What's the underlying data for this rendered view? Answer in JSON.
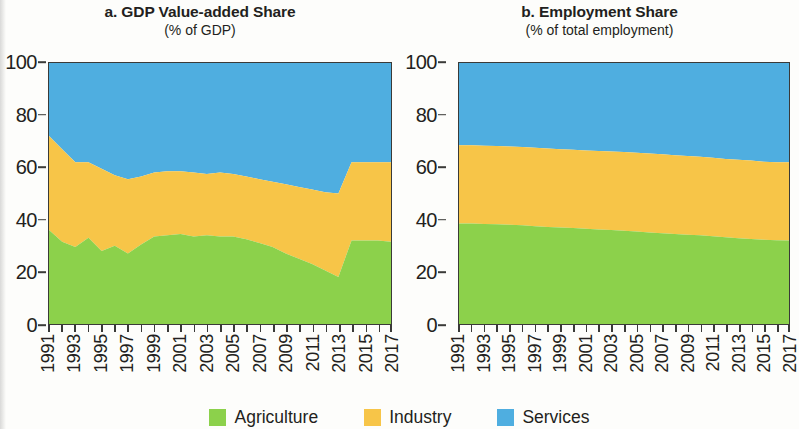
{
  "figure": {
    "legend": {
      "items": [
        {
          "label": "Agriculture",
          "color": "#8CD14B",
          "key": "agriculture"
        },
        {
          "label": "Industry",
          "color": "#F7C548",
          "key": "industry"
        },
        {
          "label": "Services",
          "color": "#4FAEE0",
          "key": "services"
        }
      ]
    }
  },
  "panels": {
    "a": {
      "title": "a. GDP Value-added Share",
      "subtitle": "(% of GDP)"
    },
    "b": {
      "title": "b. Employment Share",
      "subtitle": "(% of total employment)"
    }
  },
  "axis": {
    "y_ticks": [
      "0",
      "20",
      "40",
      "60",
      "80",
      "100"
    ],
    "y_min": 0,
    "y_max": 100,
    "x_labels": [
      "1991",
      "1993",
      "1995",
      "1997",
      "1999",
      "2001",
      "2003",
      "2005",
      "2007",
      "2009",
      "2011",
      "2013",
      "2015",
      "2017"
    ]
  },
  "chart_data": [
    {
      "type": "area",
      "stacked": true,
      "normalized": true,
      "title": "a. GDP Value-added Share",
      "subtitle": "(% of GDP)",
      "xlabel": "",
      "ylabel": "(% of GDP)",
      "ylim": [
        0,
        100
      ],
      "grid": false,
      "legend_position": "bottom",
      "x": [
        1991,
        1992,
        1993,
        1994,
        1995,
        1996,
        1997,
        1998,
        1999,
        2000,
        2001,
        2002,
        2003,
        2004,
        2005,
        2006,
        2007,
        2008,
        2009,
        2010,
        2011,
        2012,
        2013,
        2014,
        2015,
        2016,
        2017
      ],
      "tick_labels": [
        "1991",
        "1993",
        "1995",
        "1997",
        "1999",
        "2001",
        "2003",
        "2005",
        "2007",
        "2009",
        "2011",
        "2013",
        "2015",
        "2017"
      ],
      "series": [
        {
          "name": "Agriculture",
          "color": "#8CD14B",
          "values": [
            36.0,
            31.5,
            29.5,
            33.0,
            28.0,
            30.0,
            27.0,
            30.5,
            33.5,
            34.0,
            34.5,
            33.5,
            34.0,
            33.5,
            33.5,
            32.5,
            31.0,
            29.5,
            27.0,
            25.0,
            23.0,
            20.5,
            18.0,
            32.0,
            32.0,
            32.0,
            31.5
          ]
        },
        {
          "name": "Industry",
          "color": "#F7C548",
          "values": [
            36.0,
            35.5,
            32.5,
            29.0,
            31.5,
            27.0,
            28.5,
            26.0,
            24.5,
            24.5,
            24.0,
            24.5,
            23.5,
            24.5,
            24.0,
            24.0,
            24.5,
            25.0,
            26.5,
            27.5,
            28.5,
            30.0,
            32.0,
            30.0,
            30.0,
            30.0,
            30.5
          ]
        },
        {
          "name": "Services",
          "color": "#4FAEE0",
          "values": [
            28.0,
            33.0,
            38.0,
            38.0,
            40.5,
            43.0,
            44.5,
            43.5,
            42.0,
            41.5,
            41.5,
            42.0,
            42.5,
            42.0,
            42.5,
            43.5,
            44.5,
            45.5,
            46.5,
            47.5,
            48.5,
            49.5,
            50.0,
            38.0,
            38.0,
            38.0,
            38.0
          ]
        }
      ],
      "boundaries": {
        "agriculture_top": [
          36.0,
          31.5,
          29.5,
          33.0,
          28.0,
          30.0,
          27.0,
          30.5,
          33.5,
          34.0,
          34.5,
          33.5,
          34.0,
          33.5,
          33.5,
          32.5,
          31.0,
          29.5,
          27.0,
          25.0,
          23.0,
          20.5,
          18.0,
          32.0,
          32.0,
          32.0,
          31.5
        ],
        "industry_top": [
          72.0,
          67.0,
          62.0,
          62.0,
          59.5,
          57.0,
          55.5,
          56.5,
          58.0,
          58.5,
          58.5,
          58.0,
          57.5,
          58.0,
          57.5,
          56.5,
          55.5,
          54.5,
          53.5,
          52.5,
          51.5,
          50.5,
          50.0,
          62.0,
          62.0,
          62.0,
          62.0
        ]
      }
    },
    {
      "type": "area",
      "stacked": true,
      "normalized": true,
      "title": "b. Employment Share",
      "subtitle": "(% of total employment)",
      "xlabel": "",
      "ylabel": "(% of total employment)",
      "ylim": [
        0,
        100
      ],
      "grid": false,
      "legend_position": "bottom",
      "x": [
        1991,
        1992,
        1993,
        1994,
        1995,
        1996,
        1997,
        1998,
        1999,
        2000,
        2001,
        2002,
        2003,
        2004,
        2005,
        2006,
        2007,
        2008,
        2009,
        2010,
        2011,
        2012,
        2013,
        2014,
        2015,
        2016,
        2017
      ],
      "tick_labels": [
        "1991",
        "1993",
        "1995",
        "1997",
        "1999",
        "2001",
        "2003",
        "2005",
        "2007",
        "2009",
        "2011",
        "2013",
        "2015",
        "2017"
      ],
      "series": [
        {
          "name": "Agriculture",
          "color": "#8CD14B",
          "values": [
            38.5,
            38.5,
            38.3,
            38.2,
            38.0,
            37.8,
            37.5,
            37.2,
            37.0,
            36.8,
            36.5,
            36.2,
            36.0,
            35.7,
            35.4,
            35.1,
            34.8,
            34.5,
            34.2,
            34.0,
            33.6,
            33.2,
            32.9,
            32.6,
            32.3,
            32.1,
            32.0
          ]
        },
        {
          "name": "Industry",
          "color": "#F7C548",
          "values": [
            30.0,
            30.0,
            30.0,
            30.0,
            30.0,
            30.0,
            30.0,
            30.0,
            30.0,
            30.0,
            30.0,
            30.1,
            30.1,
            30.2,
            30.2,
            30.2,
            30.2,
            30.2,
            30.2,
            30.1,
            30.1,
            30.0,
            30.0,
            30.0,
            29.9,
            29.9,
            30.0
          ]
        },
        {
          "name": "Services",
          "color": "#4FAEE0",
          "values": [
            31.5,
            31.5,
            31.7,
            31.8,
            32.0,
            32.2,
            32.5,
            32.8,
            33.0,
            33.2,
            33.5,
            33.7,
            33.9,
            34.1,
            34.4,
            34.7,
            35.0,
            35.3,
            35.6,
            35.9,
            36.3,
            36.8,
            37.1,
            37.4,
            37.8,
            38.0,
            38.0
          ]
        }
      ],
      "boundaries": {
        "agriculture_top": [
          38.5,
          38.5,
          38.3,
          38.2,
          38.0,
          37.8,
          37.5,
          37.2,
          37.0,
          36.8,
          36.5,
          36.2,
          36.0,
          35.7,
          35.4,
          35.1,
          34.8,
          34.5,
          34.2,
          34.0,
          33.6,
          33.2,
          32.9,
          32.6,
          32.3,
          32.1,
          32.0
        ],
        "industry_top": [
          68.5,
          68.5,
          68.3,
          68.2,
          68.0,
          67.8,
          67.5,
          67.2,
          67.0,
          66.8,
          66.5,
          66.3,
          66.1,
          65.9,
          65.6,
          65.3,
          65.0,
          64.7,
          64.4,
          64.1,
          63.7,
          63.2,
          62.9,
          62.6,
          62.2,
          62.0,
          62.0
        ]
      }
    }
  ]
}
